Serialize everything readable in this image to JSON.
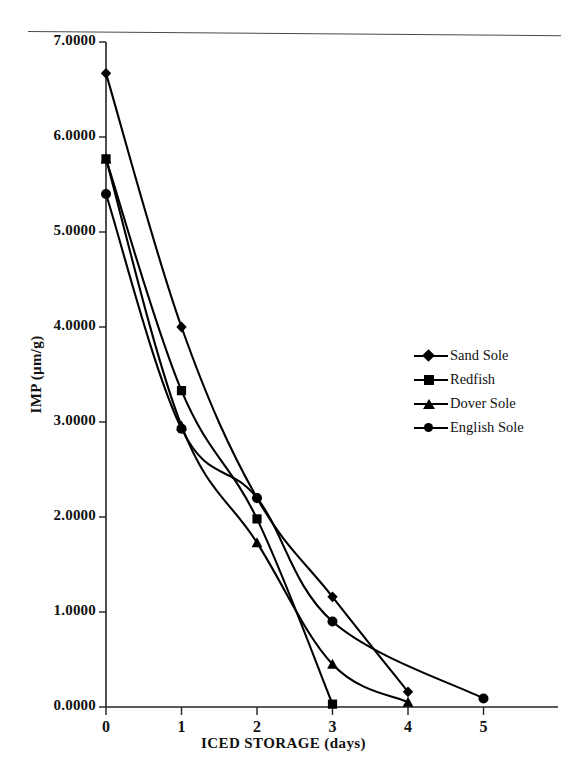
{
  "chart_data": {
    "type": "line",
    "title": "",
    "xlabel": "ICED STORAGE (days)",
    "ylabel": "IMP (µm/g)",
    "xlim": [
      0,
      5
    ],
    "ylim": [
      0,
      7
    ],
    "grid": false,
    "legend_position": "right",
    "x_ticks": [
      "0",
      "1",
      "2",
      "3",
      "4",
      "5"
    ],
    "y_ticks": [
      "0.0000",
      "1.0000",
      "2.0000",
      "3.0000",
      "4.0000",
      "5.0000",
      "6.0000",
      "7.0000"
    ],
    "series": [
      {
        "name": "Sand Sole",
        "marker": "diamond",
        "x": [
          0,
          1,
          2,
          3,
          4
        ],
        "y": [
          6.67,
          4.0,
          2.2,
          1.16,
          0.16
        ]
      },
      {
        "name": "Redfish",
        "marker": "square",
        "x": [
          0,
          1,
          2,
          3
        ],
        "y": [
          5.77,
          3.33,
          1.98,
          0.03
        ]
      },
      {
        "name": "Dover Sole",
        "marker": "triangle",
        "x": [
          0,
          1,
          2,
          3,
          4
        ],
        "y": [
          5.77,
          2.96,
          1.73,
          0.45,
          0.05
        ]
      },
      {
        "name": "English Sole",
        "marker": "circle",
        "x": [
          0,
          1,
          2,
          3,
          5
        ],
        "y": [
          5.4,
          2.93,
          2.2,
          0.9,
          0.09
        ]
      }
    ]
  },
  "axis": {
    "x_title": "ICED STORAGE (days)",
    "y_title": "IMP (µm/g)"
  },
  "legend": {
    "items": [
      {
        "label": "Sand Sole",
        "marker": "diamond-marker-icon"
      },
      {
        "label": "Redfish",
        "marker": "square-marker-icon"
      },
      {
        "label": "Dover Sole",
        "marker": "triangle-marker-icon"
      },
      {
        "label": "English Sole",
        "marker": "circle-marker-icon"
      }
    ]
  },
  "style": {
    "line_color": "#000000",
    "axis_color": "#222222",
    "background": "#ffffff"
  }
}
